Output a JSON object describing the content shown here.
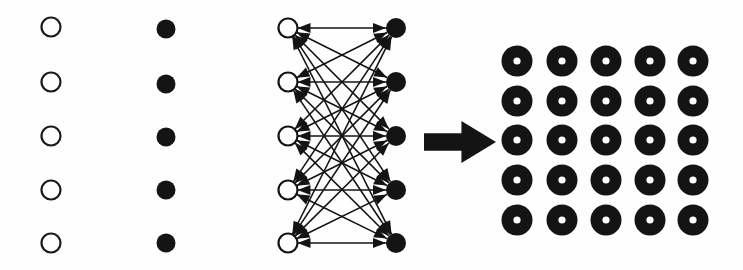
{
  "figure": {
    "title": "Bipartite network combination diagram",
    "background_color": "#fefefe",
    "ink_color": "#111111",
    "width": 743,
    "height": 270,
    "panels": [
      {
        "id": "open-node-column",
        "name": "open-circle-column",
        "label": "Column of open circles",
        "glyph": "open-circle",
        "count": 5,
        "center_x": 51,
        "radius": 9.5,
        "stroke_width": 2.2,
        "fill": "none",
        "stroke": "#1a1a1a",
        "centers_y": [
          27,
          82,
          136,
          190,
          243
        ]
      },
      {
        "id": "filled-node-column",
        "name": "filled-dot-column",
        "label": "Column of filled dots",
        "glyph": "filled-circle",
        "count": 5,
        "center_x": 166,
        "radius": 9.5,
        "fill": "#141414",
        "stroke": "none",
        "centers_y": [
          29,
          84,
          137,
          190,
          243
        ]
      },
      {
        "id": "bipartite-network",
        "name": "bipartite-network-panel",
        "label": "Fully connected bidirectional bipartite network",
        "left_layer": {
          "glyph": "open-circle",
          "count": 5,
          "center_x": 288,
          "radius": 9.5,
          "stroke_width": 2.2,
          "fill": "#ffffff",
          "stroke": "#141414",
          "centers_y": [
            28,
            82,
            136,
            190,
            243
          ]
        },
        "right_layer": {
          "glyph": "filled-circle",
          "count": 5,
          "center_x": 396,
          "radius": 10,
          "fill": "#141414",
          "stroke": "none",
          "centers_y": [
            28,
            82,
            136,
            190,
            243
          ]
        },
        "edges": {
          "kind": "complete-bipartite",
          "directionality": "bidirectional",
          "total_edges": 25,
          "total_arrowheads": 50,
          "line_width": 1.6,
          "arrowhead_length": 13,
          "arrowhead_half_width": 5,
          "color": "#141414"
        }
      },
      {
        "id": "transform-arrow",
        "name": "block-arrow",
        "label": "Rightward block arrow",
        "glyph": "right-block-arrow",
        "x": 424,
        "y": 121,
        "width": 72,
        "height": 42,
        "shaft_height_ratio": 0.42,
        "head_width_ratio": 0.48,
        "fill": "#141414"
      },
      {
        "id": "combined-grid",
        "name": "donut-grid-panel",
        "label": "5 by 5 grid of combined donut units",
        "glyph": "donut",
        "rows": 5,
        "columns": 5,
        "count": 25,
        "outer_radius": 15.5,
        "inner_radius": 3.6,
        "fill": "#141414",
        "hole_fill": "#ffffff",
        "centers_x": [
          517,
          562,
          606,
          650,
          693
        ],
        "centers_y": [
          61,
          101,
          140,
          180,
          220
        ]
      }
    ]
  }
}
